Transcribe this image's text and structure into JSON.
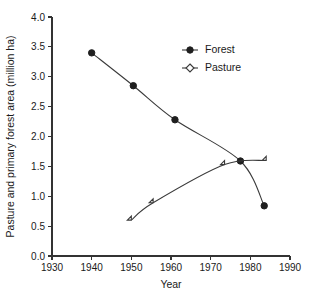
{
  "chart_data": {
    "type": "line",
    "title": "",
    "xlabel": "Year",
    "ylabel": "Pasture and primary forest area (million ha)",
    "xlim": [
      1930,
      1990
    ],
    "ylim": [
      0.0,
      4.0
    ],
    "xticks": [
      1930,
      1940,
      1950,
      1960,
      1970,
      1980,
      1990
    ],
    "xtick_labels": [
      "1930",
      "1940",
      "1950",
      "1960",
      "1970",
      "1980",
      "1990"
    ],
    "yticks": [
      0.0,
      0.5,
      1.0,
      1.5,
      2.0,
      2.5,
      3.0,
      3.5,
      4.0
    ],
    "ytick_labels": [
      "0.0",
      "0.5",
      "1.0",
      "1.5",
      "2.0",
      "2.5",
      "3.0",
      "3.5",
      "4.0"
    ],
    "grid": false,
    "legend_position": "upper-center-right",
    "series": [
      {
        "name": "Forest",
        "marker": "filled-circle",
        "x": [
          1940,
          1950.5,
          1961,
          1977.5,
          1983.5
        ],
        "values": [
          3.4,
          2.85,
          2.28,
          1.59,
          0.84
        ]
      },
      {
        "name": "Pasture",
        "marker": "open-diamond",
        "x": [
          1950,
          1955.5,
          1973.5,
          1984
        ],
        "values": [
          0.6,
          0.89,
          1.53,
          1.6
        ]
      }
    ],
    "colors": {
      "forest_marker": "#1f1f1f",
      "pasture_marker": "#ffffff",
      "line": "#3a3a3a",
      "axis": "#333333",
      "background": "#ffffff"
    }
  },
  "legend": {
    "entries": [
      {
        "label": "Forest"
      },
      {
        "label": "Pasture"
      }
    ]
  },
  "axes": {
    "x_title": "Year",
    "y_title": "Pasture and primary forest area (million ha)"
  }
}
